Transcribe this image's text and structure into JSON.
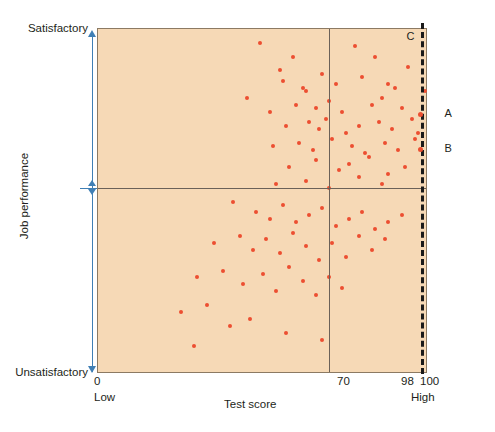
{
  "figure": {
    "plot_background": "#f6d9b6",
    "point_color": "#ec4f31",
    "axis_arrow_color": "#3f7fb5"
  },
  "yaxis": {
    "top_label": "Satisfactory",
    "bottom_label": "Unsatisfactory",
    "title": "Job performance"
  },
  "xaxis": {
    "title": "Test score",
    "tick_zero": "0",
    "tick_cutoff": "70",
    "tick_98": "98",
    "tick_100": "100",
    "low_label": "Low",
    "high_label": "High"
  },
  "annotations": {
    "c_label": "C",
    "a_label": "A",
    "b_label": "B"
  },
  "chart_data": {
    "type": "scatter",
    "title": "",
    "xlabel": "Test score",
    "ylabel": "Job performance",
    "xlim": [
      0,
      100
    ],
    "ylim": [
      0,
      100
    ],
    "grid": false,
    "legend": "none",
    "xticks": [
      {
        "value": 0,
        "label": "0",
        "sublabel": "Low"
      },
      {
        "value": 70,
        "label": "70"
      },
      {
        "value": 98,
        "label": "98"
      },
      {
        "value": 100,
        "label": "100",
        "sublabel": "High"
      }
    ],
    "yticks": [
      {
        "value": 100,
        "label": "Satisfactory"
      },
      {
        "value": 0,
        "label": "Unsatisfactory"
      }
    ],
    "reference_lines": [
      {
        "name": "test-score-cutoff",
        "orientation": "vertical",
        "value": 70,
        "style": "solid",
        "color": "#6b6158"
      },
      {
        "name": "job-performance-cutoff",
        "orientation": "horizontal",
        "value": 54,
        "style": "solid",
        "color": "#6b6158"
      },
      {
        "name": "selection-cutoff-98",
        "orientation": "vertical",
        "value": 98,
        "style": "dashed",
        "color": "#1a1a1a",
        "label": "C"
      }
    ],
    "annotated_points": [
      {
        "label": "A",
        "x": 98,
        "y": 75
      },
      {
        "label": "B",
        "x": 98,
        "y": 65
      }
    ],
    "points": [
      [
        49,
        96
      ],
      [
        59,
        92
      ],
      [
        55,
        88
      ],
      [
        78,
        95
      ],
      [
        68,
        87
      ],
      [
        84,
        92
      ],
      [
        94,
        89
      ],
      [
        45,
        80
      ],
      [
        56,
        85
      ],
      [
        62,
        83
      ],
      [
        63,
        82
      ],
      [
        72,
        84
      ],
      [
        80,
        86
      ],
      [
        88,
        84
      ],
      [
        90,
        83
      ],
      [
        99,
        82
      ],
      [
        52,
        76
      ],
      [
        60,
        78
      ],
      [
        66,
        77
      ],
      [
        70,
        79
      ],
      [
        74,
        76
      ],
      [
        83,
        78
      ],
      [
        86,
        80
      ],
      [
        92,
        77
      ],
      [
        57,
        72
      ],
      [
        64,
        73
      ],
      [
        67,
        71
      ],
      [
        69,
        74
      ],
      [
        75,
        70
      ],
      [
        79,
        72
      ],
      [
        85,
        73
      ],
      [
        89,
        71
      ],
      [
        95,
        74
      ],
      [
        97,
        70
      ],
      [
        53,
        66
      ],
      [
        61,
        67
      ],
      [
        65,
        65
      ],
      [
        71,
        68
      ],
      [
        77,
        66
      ],
      [
        81,
        64
      ],
      [
        87,
        67
      ],
      [
        91,
        65
      ],
      [
        96,
        68
      ],
      [
        58,
        60
      ],
      [
        66,
        62
      ],
      [
        73,
        59
      ],
      [
        76,
        61
      ],
      [
        82,
        63
      ],
      [
        88,
        58
      ],
      [
        93,
        60
      ],
      [
        54,
        55
      ],
      [
        63,
        56
      ],
      [
        70,
        54
      ],
      [
        79,
        57
      ],
      [
        86,
        55
      ],
      [
        41,
        50
      ],
      [
        48,
        47
      ],
      [
        52,
        45
      ],
      [
        56,
        49
      ],
      [
        60,
        44
      ],
      [
        64,
        46
      ],
      [
        68,
        48
      ],
      [
        72,
        43
      ],
      [
        76,
        45
      ],
      [
        80,
        47
      ],
      [
        84,
        42
      ],
      [
        88,
        44
      ],
      [
        92,
        46
      ],
      [
        35,
        38
      ],
      [
        43,
        40
      ],
      [
        47,
        36
      ],
      [
        51,
        39
      ],
      [
        55,
        35
      ],
      [
        59,
        41
      ],
      [
        63,
        37
      ],
      [
        67,
        33
      ],
      [
        71,
        38
      ],
      [
        75,
        34
      ],
      [
        79,
        40
      ],
      [
        83,
        36
      ],
      [
        87,
        39
      ],
      [
        30,
        28
      ],
      [
        38,
        30
      ],
      [
        44,
        26
      ],
      [
        50,
        29
      ],
      [
        54,
        24
      ],
      [
        58,
        31
      ],
      [
        62,
        27
      ],
      [
        66,
        23
      ],
      [
        70,
        28
      ],
      [
        74,
        25
      ],
      [
        25,
        18
      ],
      [
        33,
        20
      ],
      [
        40,
        14
      ],
      [
        46,
        16
      ],
      [
        57,
        12
      ],
      [
        68,
        10
      ],
      [
        29,
        8
      ]
    ]
  }
}
